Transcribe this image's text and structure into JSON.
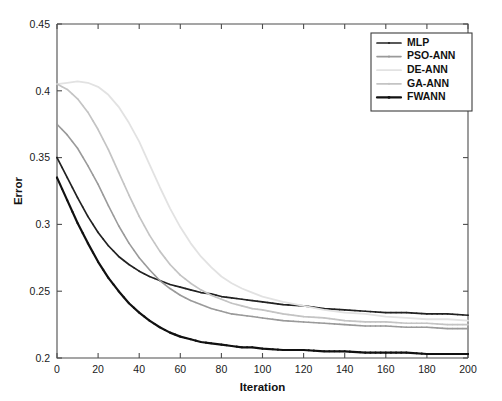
{
  "chart_data": {
    "type": "line",
    "title": "",
    "xlabel": "Iteration",
    "ylabel": "Error",
    "xlim": [
      0,
      200
    ],
    "ylim": [
      0.2,
      0.45
    ],
    "xticks": [
      0,
      20,
      40,
      60,
      80,
      100,
      120,
      140,
      160,
      180,
      200
    ],
    "yticks": [
      0.2,
      0.25,
      0.3,
      0.35,
      0.4,
      0.45
    ],
    "xtick_labels": [
      "0",
      "20",
      "40",
      "60",
      "80",
      "100",
      "120",
      "140",
      "160",
      "180",
      "200"
    ],
    "ytick_labels": [
      "0.2",
      "0.25",
      "0.3",
      "0.35",
      "0.4",
      "0.45"
    ],
    "grid": false,
    "legend_position": "top-right",
    "legend_entries": [
      "MLP",
      "PSO-ANN",
      "DE-ANN",
      "GA-ANN",
      "FWANN"
    ],
    "x": [
      0,
      5,
      10,
      15,
      20,
      25,
      30,
      35,
      40,
      45,
      50,
      55,
      60,
      65,
      70,
      75,
      80,
      85,
      90,
      95,
      100,
      110,
      120,
      130,
      140,
      150,
      160,
      170,
      180,
      190,
      200
    ],
    "series": [
      {
        "name": "MLP",
        "color": "#222222",
        "width": 1.7,
        "marker": "dot",
        "values": [
          0.35,
          0.335,
          0.32,
          0.306,
          0.294,
          0.284,
          0.276,
          0.27,
          0.265,
          0.261,
          0.258,
          0.255,
          0.253,
          0.251,
          0.249,
          0.248,
          0.246,
          0.245,
          0.244,
          0.243,
          0.242,
          0.24,
          0.239,
          0.237,
          0.236,
          0.235,
          0.234,
          0.234,
          0.233,
          0.233,
          0.232
        ]
      },
      {
        "name": "PSO-ANN",
        "color": "#9a9a9a",
        "width": 1.6,
        "marker": "dot",
        "values": [
          0.375,
          0.367,
          0.357,
          0.344,
          0.33,
          0.314,
          0.299,
          0.286,
          0.275,
          0.266,
          0.258,
          0.252,
          0.247,
          0.243,
          0.24,
          0.237,
          0.235,
          0.233,
          0.232,
          0.231,
          0.23,
          0.228,
          0.227,
          0.226,
          0.225,
          0.224,
          0.224,
          0.223,
          0.223,
          0.222,
          0.222
        ]
      },
      {
        "name": "DE-ANN",
        "color": "#e2e2e2",
        "width": 1.8,
        "marker": "none",
        "values": [
          0.405,
          0.406,
          0.407,
          0.406,
          0.403,
          0.397,
          0.388,
          0.376,
          0.362,
          0.345,
          0.328,
          0.312,
          0.298,
          0.286,
          0.276,
          0.268,
          0.261,
          0.256,
          0.252,
          0.249,
          0.246,
          0.242,
          0.239,
          0.236,
          0.234,
          0.233,
          0.231,
          0.23,
          0.229,
          0.229,
          0.228
        ]
      },
      {
        "name": "GA-ANN",
        "color": "#c4c4c4",
        "width": 1.7,
        "marker": "dot",
        "values": [
          0.405,
          0.401,
          0.394,
          0.384,
          0.371,
          0.356,
          0.339,
          0.322,
          0.306,
          0.292,
          0.28,
          0.27,
          0.262,
          0.256,
          0.251,
          0.247,
          0.244,
          0.241,
          0.239,
          0.237,
          0.236,
          0.233,
          0.231,
          0.23,
          0.228,
          0.227,
          0.227,
          0.226,
          0.226,
          0.225,
          0.225
        ]
      },
      {
        "name": "FWANN",
        "color": "#111111",
        "width": 2.2,
        "marker": "dot",
        "values": [
          0.335,
          0.318,
          0.301,
          0.286,
          0.272,
          0.26,
          0.25,
          0.241,
          0.234,
          0.228,
          0.223,
          0.219,
          0.216,
          0.214,
          0.212,
          0.211,
          0.21,
          0.209,
          0.208,
          0.208,
          0.207,
          0.206,
          0.206,
          0.205,
          0.205,
          0.204,
          0.204,
          0.204,
          0.203,
          0.203,
          0.203
        ]
      }
    ]
  }
}
